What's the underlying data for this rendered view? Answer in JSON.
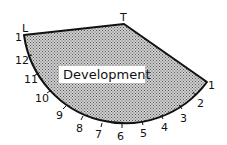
{
  "diagram": {
    "title_label": "Development",
    "apex_label": "T",
    "start_label": "L",
    "start_number": "1",
    "end_number": "1",
    "arc_divisions": [
      "2",
      "3",
      "4",
      "5",
      "6",
      "7",
      "8",
      "9",
      "10",
      "11",
      "12"
    ],
    "colors": {
      "stroke": "#111111",
      "fill_pattern": "#888888",
      "background": "#ffffff"
    }
  }
}
